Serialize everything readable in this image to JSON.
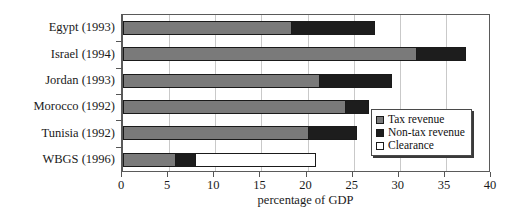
{
  "chart_data": {
    "type": "bar",
    "orientation": "horizontal",
    "stacked": true,
    "title": "",
    "xlabel": "percentage of GDP",
    "ylabel": "",
    "xlim": [
      0,
      40
    ],
    "xticks": [
      0,
      5,
      10,
      15,
      20,
      25,
      30,
      35,
      40
    ],
    "grid": true,
    "grid_axis": "x",
    "legend_position": "right-inside",
    "categories": [
      "Egypt (1993)",
      "Israel  (1994)",
      "Jordan (1993)",
      "Morocco (1992)",
      "Tunisia (1992)",
      "WBGS (1996)"
    ],
    "series": [
      {
        "name": "Tax revenue",
        "color": "#7a7a7a",
        "values": [
          18.2,
          31.8,
          21.2,
          24.1,
          20.0,
          5.6
        ]
      },
      {
        "name": "Non-tax revenue",
        "color": "#1d1d1d",
        "values": [
          9.1,
          5.4,
          8.0,
          2.6,
          5.4,
          2.2
        ]
      },
      {
        "name": "Clearance",
        "color": "#ffffff",
        "values": [
          0,
          0,
          0,
          0,
          0,
          13.1
        ]
      }
    ],
    "totals": [
      27.3,
      37.2,
      29.2,
      26.7,
      25.4,
      20.9
    ]
  },
  "legend": {
    "items": [
      {
        "label": "Tax revenue"
      },
      {
        "label": "Non-tax revenue"
      },
      {
        "label": "Clearance"
      }
    ]
  },
  "axis": {
    "x_title": "percentage of GDP"
  }
}
